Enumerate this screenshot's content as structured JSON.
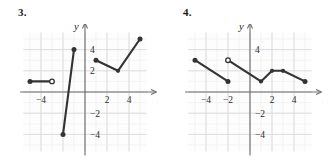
{
  "page": {
    "background": "#ffffff",
    "ink": "#2b2b2b",
    "grid_color": "#d9d9d9",
    "grid_minor_color": "#ececec",
    "axis_color": "#6e6e6e",
    "curve_color": "#333333"
  },
  "problems": [
    {
      "number": "3.",
      "x_axis_letter": "x",
      "y_axis_letter": "y",
      "chart_data": {
        "type": "line",
        "title": "3.",
        "xlabel": "x",
        "ylabel": "y",
        "xlim": [
          -6,
          6
        ],
        "ylim": [
          -6,
          6
        ],
        "xticks": [
          -4,
          2,
          4
        ],
        "xtick_labels": [
          "-4",
          "2",
          "4"
        ],
        "yticks": [
          4,
          2,
          -2,
          -4
        ],
        "ytick_labels": [
          "4",
          "2",
          "-2",
          "-4"
        ],
        "grid": true,
        "grid_major_step": 2,
        "grid_minor_step": 1,
        "legend": "none",
        "series": [
          {
            "name": "segment-1",
            "points": [
              [
                -5,
                1
              ],
              [
                -3,
                1
              ]
            ],
            "start_marker": "filled",
            "end_marker": "open"
          },
          {
            "name": "segment-2",
            "points": [
              [
                -2,
                -4
              ],
              [
                -1,
                4
              ]
            ],
            "start_marker": "filled",
            "end_marker": "filled"
          },
          {
            "name": "segment-3",
            "points": [
              [
                1,
                3
              ],
              [
                3,
                2
              ],
              [
                5,
                5
              ]
            ],
            "start_marker": "filled",
            "end_marker": "filled"
          }
        ]
      }
    },
    {
      "number": "4.",
      "x_axis_letter": "x",
      "y_axis_letter": "y",
      "chart_data": {
        "type": "line",
        "title": "4.",
        "xlabel": "x",
        "ylabel": "y",
        "xlim": [
          -6,
          6
        ],
        "ylim": [
          -6,
          6
        ],
        "xticks": [
          -4,
          -2,
          2,
          4
        ],
        "xtick_labels": [
          "-4",
          "-2",
          "2",
          "4"
        ],
        "yticks": [
          4,
          -2,
          -4
        ],
        "ytick_labels": [
          "4",
          "-2",
          "-4"
        ],
        "grid": true,
        "grid_major_step": 2,
        "grid_minor_step": 1,
        "legend": "none",
        "series": [
          {
            "name": "segment-1",
            "points": [
              [
                -5,
                3
              ],
              [
                -2,
                1
              ]
            ],
            "start_marker": "filled",
            "end_marker": "filled"
          },
          {
            "name": "segment-2",
            "points": [
              [
                -2,
                3
              ],
              [
                1,
                1
              ],
              [
                2,
                2
              ],
              [
                3,
                2
              ],
              [
                5,
                1
              ]
            ],
            "start_marker": "open",
            "end_marker": "filled"
          }
        ]
      }
    }
  ]
}
